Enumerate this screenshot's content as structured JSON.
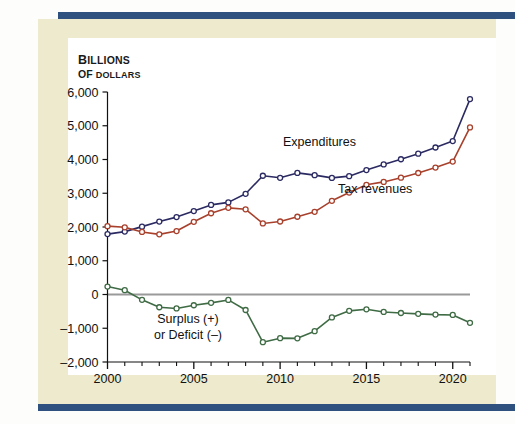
{
  "figure": {
    "background_color": "#fdfdfb",
    "mat_color": "#eeeacd",
    "panel_color": "#ffffff",
    "band_color": "#2e5180"
  },
  "axis_title": {
    "line1": "BILLIONS",
    "line1_cap": "B",
    "line1_rest": "ILLIONS",
    "line2": "OF DOLLARS",
    "line2_cap": "OF",
    "line2_rest": " DOLLARS"
  },
  "labels": {
    "expenditures": "Expenditures",
    "tax_revenues": "Tax revenues",
    "deficit_line1": "Surplus (+)",
    "deficit_line2": "or Deficit (–)"
  },
  "chart_data": {
    "type": "line",
    "title": "",
    "subtitle": "",
    "xlabel": "",
    "ylabel": "Billions of dollars",
    "xlim": [
      2000,
      2021
    ],
    "ylim": [
      -2000,
      6000
    ],
    "ytick_step": 1000,
    "grid": false,
    "legend": "inline-annotations",
    "zero_line": true,
    "zero_line_color": "#9a9a9a",
    "x_major_ticks": [
      2000,
      2005,
      2010,
      2015,
      2020
    ],
    "x_major_tick_labels": [
      "2000",
      "2005",
      "2010",
      "2015",
      "2020"
    ],
    "x_minor_ticks": [
      2001,
      2002,
      2003,
      2004,
      2006,
      2007,
      2008,
      2009,
      2011,
      2012,
      2013,
      2014,
      2016,
      2017,
      2018,
      2019,
      2021
    ],
    "ytick_labels": [
      "6,000",
      "5,000",
      "4,000",
      "3,000",
      "2,000",
      "1,000",
      "0",
      "–1,000",
      "–2,000"
    ],
    "ytick_values": [
      6000,
      5000,
      4000,
      3000,
      2000,
      1000,
      0,
      -1000,
      -2000
    ],
    "x": [
      2000,
      2001,
      2002,
      2003,
      2004,
      2005,
      2006,
      2007,
      2008,
      2009,
      2010,
      2011,
      2012,
      2013,
      2014,
      2015,
      2016,
      2017,
      2018,
      2019,
      2020,
      2021
    ],
    "series": [
      {
        "name": "Expenditures",
        "color": "#2b2a62",
        "marker": "open-circle",
        "values": [
          1790,
          1863,
          2011,
          2160,
          2293,
          2472,
          2655,
          2729,
          2983,
          3518,
          3457,
          3603,
          3537,
          3455,
          3506,
          3688,
          3853,
          4008,
          4173,
          4356,
          4546,
          5790
        ]
      },
      {
        "name": "Tax revenues",
        "color": "#a8402c",
        "marker": "open-circle",
        "values": [
          2025,
          1991,
          1853,
          1782,
          1880,
          2154,
          2407,
          2568,
          2524,
          2105,
          2163,
          2304,
          2450,
          2775,
          3021,
          3250,
          3336,
          3460,
          3600,
          3760,
          3940,
          4950
        ]
      },
      {
        "name": "Surplus (+) or Deficit (–)",
        "color": "#3f6b45",
        "marker": "open-circle",
        "values": [
          236,
          128,
          -158,
          -378,
          -413,
          -318,
          -248,
          -161,
          -459,
          -1413,
          -1294,
          -1299,
          -1087,
          -680,
          -485,
          -438,
          -517,
          -548,
          -573,
          -596,
          -606,
          -840
        ]
      }
    ]
  }
}
